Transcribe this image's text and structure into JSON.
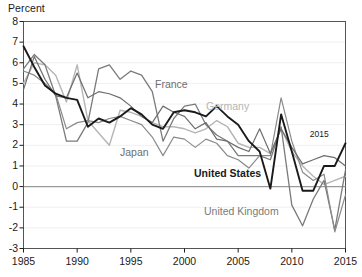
{
  "chart_data": {
    "type": "line",
    "title": "",
    "subtitle": "",
    "xlabel": "",
    "ylabel": "Percent",
    "ylim": [
      -3,
      8
    ],
    "xlim": [
      1985,
      2015
    ],
    "yticks": [
      8,
      7,
      6,
      5,
      4,
      3,
      2,
      1,
      0,
      -1,
      -2,
      -3
    ],
    "xticks": [
      1985,
      1990,
      1995,
      2000,
      2005,
      2010,
      2015
    ],
    "grid": "horizontal-faint",
    "zero_line": true,
    "legend_position": "inline-annotations",
    "x": [
      1985,
      1986,
      1987,
      1988,
      1989,
      1990,
      1991,
      1992,
      1993,
      1994,
      1995,
      1996,
      1997,
      1998,
      1999,
      2000,
      2001,
      2002,
      2003,
      2004,
      2005,
      2006,
      2007,
      2008,
      2009,
      2010,
      2011,
      2012,
      2013,
      2014,
      2015
    ],
    "series": [
      {
        "name": "United States",
        "color": "#1a1a1a",
        "width": 1.9,
        "values": [
          6.8,
          5.8,
          4.9,
          4.5,
          4.3,
          4.2,
          2.9,
          3.3,
          3.1,
          3.4,
          3.8,
          3.5,
          3.0,
          2.8,
          3.6,
          3.7,
          3.6,
          3.4,
          3.9,
          3.4,
          3.0,
          2.2,
          1.7,
          -0.1,
          3.5,
          1.7,
          -0.2,
          -0.2,
          1.0,
          1.0,
          2.1
        ]
      },
      {
        "name": "France",
        "color": "#6e6e6e",
        "width": 1.2,
        "values": [
          4.7,
          6.3,
          5.2,
          4.4,
          4.3,
          5.5,
          4.3,
          4.6,
          4.5,
          4.3,
          3.9,
          3.4,
          3.1,
          3.9,
          3.6,
          3.4,
          2.8,
          3.1,
          2.3,
          2.2,
          1.9,
          1.7,
          2.8,
          1.6,
          2.8,
          1.9,
          1.1,
          1.3,
          1.5,
          1.4,
          1.0
        ]
      },
      {
        "name": "Germany",
        "color": "#b5b5b5",
        "width": 1.4,
        "values": [
          5.0,
          6.0,
          5.9,
          5.4,
          4.1,
          5.9,
          3.2,
          2.6,
          2.0,
          3.7,
          3.6,
          3.4,
          3.1,
          2.9,
          2.9,
          2.8,
          2.6,
          2.8,
          3.2,
          2.9,
          2.1,
          1.9,
          1.9,
          1.6,
          2.8,
          1.7,
          1.0,
          0.5,
          0.1,
          0.3,
          0.5
        ]
      },
      {
        "name": "Japan",
        "color": "#8a8a8a",
        "width": 1.2,
        "values": [
          5.6,
          5.4,
          5.0,
          4.5,
          2.8,
          3.1,
          3.2,
          3.1,
          3.3,
          3.4,
          3.2,
          3.0,
          2.4,
          1.5,
          2.4,
          2.3,
          1.9,
          2.3,
          2.1,
          1.5,
          1.3,
          0.9,
          1.5,
          1.5,
          4.3,
          2.2,
          0.7,
          0.3,
          0.6,
          -2.2,
          -0.4
        ]
      },
      {
        "name": "United Kingdom",
        "color": "#7a7a7a",
        "width": 1.3,
        "values": [
          5.7,
          6.4,
          5.9,
          4.4,
          2.2,
          2.2,
          3.1,
          5.7,
          5.9,
          5.2,
          5.6,
          5.4,
          4.6,
          2.2,
          3.3,
          3.9,
          4.0,
          3.0,
          2.5,
          2.2,
          1.5,
          1.5,
          1.5,
          1.3,
          2.9,
          -0.9,
          -1.9,
          -0.6,
          0.3,
          -2.1,
          0.8
        ]
      }
    ],
    "annotations": [
      {
        "text": "2015",
        "x": 2012.6,
        "y": 2.5,
        "color": "#1a1a1a"
      }
    ],
    "series_labels": [
      {
        "text": "France",
        "color": "#6e6e6e",
        "x": 155,
        "y": 78
      },
      {
        "text": "Germany",
        "color": "#b5b5b5",
        "x": 206,
        "y": 100
      },
      {
        "text": "Japan",
        "color": "#6e6e6e",
        "x": 120,
        "y": 146
      },
      {
        "text": "United States",
        "color": "#1a1a1a",
        "bold": true,
        "x": 194,
        "y": 167
      },
      {
        "text": "United Kingdom",
        "color": "#7a7a7a",
        "x": 204,
        "y": 205
      }
    ]
  },
  "axis": {
    "unit_label": "Percent",
    "ytick_labels": [
      "8",
      "7",
      "6",
      "5",
      "4",
      "3",
      "2",
      "1",
      "0",
      "-1",
      "-2",
      "-3"
    ],
    "xtick_labels": [
      "1985",
      "1990",
      "1995",
      "2000",
      "2005",
      "2010",
      "2015"
    ]
  },
  "colors": {
    "axis": "#1a1a1a",
    "frame": "#555555",
    "grid": "#f0f0f0",
    "zero_line": "#9a9a9a",
    "background": "#ffffff"
  }
}
